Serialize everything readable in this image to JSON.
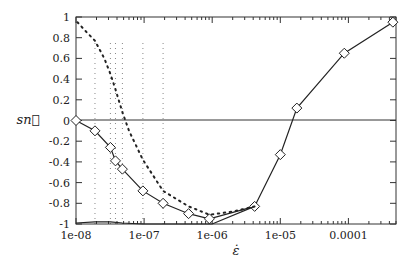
{
  "chart_data": {
    "type": "line",
    "title": "",
    "xlabel": "ε̇",
    "ylabel": "sn⃗",
    "xscale": "log",
    "xlim": [
      1e-08,
      0.0005
    ],
    "ylim": [
      -1,
      1
    ],
    "grid": false,
    "legend": null,
    "x_ticks": [
      {
        "value": 1e-08,
        "label": "1e-08"
      },
      {
        "value": 1e-07,
        "label": "1e-07"
      },
      {
        "value": 1e-06,
        "label": "1e-06"
      },
      {
        "value": 1e-05,
        "label": "1e-05"
      },
      {
        "value": 0.0001,
        "label": "0.0001"
      }
    ],
    "y_ticks": [
      {
        "value": 1,
        "label": "1"
      },
      {
        "value": 0.8,
        "label": "0.8"
      },
      {
        "value": 0.6,
        "label": "0.6"
      },
      {
        "value": 0.4,
        "label": "0.4"
      },
      {
        "value": 0.2,
        "label": "0.2"
      },
      {
        "value": 0,
        "label": "0"
      },
      {
        "value": -0.2,
        "label": "-0.2"
      },
      {
        "value": -0.4,
        "label": "-0.4"
      },
      {
        "value": -0.6,
        "label": "-0.6"
      },
      {
        "value": -0.8,
        "label": "-0.8"
      },
      {
        "value": -1,
        "label": "-1"
      }
    ],
    "reference_lines": [
      {
        "orientation": "horizontal",
        "y": 0,
        "style": "solid"
      }
    ],
    "series": [
      {
        "name": "mean (solid, diamond markers)",
        "style": "solid",
        "marker": "diamond",
        "x": [
          1e-08,
          1.9e-08,
          3.2e-08,
          3.8e-08,
          4.8e-08,
          9.6e-08,
          1.9e-07,
          4.5e-07,
          9.1e-07,
          4.2e-06,
          1e-05,
          1.75e-05,
          8.7e-05,
          0.00045
        ],
        "y": [
          0.0,
          -0.1,
          -0.26,
          -0.39,
          -0.47,
          -0.68,
          -0.8,
          -0.9,
          -0.95,
          -0.83,
          -0.33,
          0.12,
          0.65,
          0.95
        ]
      },
      {
        "name": "upper bound (dotted)",
        "style": "dotted",
        "marker": "none",
        "x": [
          1.05e-08,
          1.4e-08,
          1.9e-08,
          2.6e-08,
          3.2e-08,
          3.8e-08,
          4.8e-08,
          6e-08,
          9.6e-08,
          1.9e-07,
          4.5e-07,
          9.1e-07,
          2e-06,
          4.2e-06
        ],
        "y": [
          0.95,
          0.86,
          0.77,
          0.6,
          0.45,
          0.3,
          0.08,
          -0.1,
          -0.38,
          -0.68,
          -0.83,
          -0.91,
          -0.88,
          -0.83
        ]
      },
      {
        "name": "lower bound (solid)",
        "style": "solid",
        "marker": "none",
        "x": [
          1e-08,
          1.9e-08,
          3.2e-08,
          4.8e-08,
          9.6e-08,
          1.9e-07,
          4.5e-07,
          9.1e-07,
          1e-06,
          4.2e-06
        ],
        "y": [
          -0.99,
          -0.98,
          -0.98,
          -0.99,
          -1.0,
          -1.0,
          -1.0,
          -1.0,
          -1.0,
          -0.83
        ]
      },
      {
        "name": "vertical dotted markers",
        "style": "dotted",
        "marker": "none",
        "x_positions": [
          1.9e-08,
          3.2e-08,
          3.8e-08,
          4.8e-08,
          9.6e-08,
          1.9e-07
        ],
        "y_range": [
          -1,
          0.77
        ]
      }
    ]
  }
}
